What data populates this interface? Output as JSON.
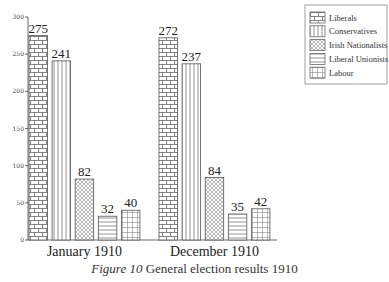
{
  "chart_data": {
    "type": "bar",
    "title": "General election results 1910",
    "caption_label": "Figure 10",
    "caption_text": "General election results 1910",
    "categories": [
      "January 1910",
      "December 1910"
    ],
    "series": [
      {
        "name": "Liberals",
        "values": [
          275,
          272
        ],
        "pattern": "brick"
      },
      {
        "name": "Conservatives",
        "values": [
          241,
          237
        ],
        "pattern": "vertical-lines"
      },
      {
        "name": "Irish Nationalists",
        "values": [
          82,
          84
        ],
        "pattern": "crosshatch"
      },
      {
        "name": "Liberal Unionists",
        "values": [
          32,
          35
        ],
        "pattern": "horizontal-lines"
      },
      {
        "name": "Labour",
        "values": [
          40,
          42
        ],
        "pattern": "grid"
      }
    ],
    "xlabel": "",
    "ylabel": "",
    "ylim": [
      0,
      300
    ],
    "yticks": [
      0,
      50,
      100,
      150,
      200,
      250,
      300
    ],
    "grid": false,
    "legend_position": "top-right"
  }
}
